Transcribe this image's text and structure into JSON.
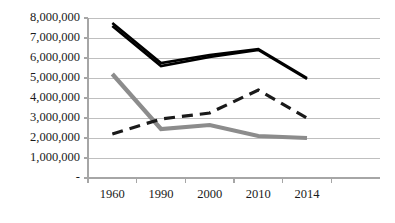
{
  "chart_data": {
    "type": "line",
    "title": "",
    "subtitle": "",
    "xlabel": "",
    "ylabel": "",
    "categories": [
      "1960",
      "1990",
      "2000",
      "2010",
      "2014"
    ],
    "ylim": [
      0,
      8000000
    ],
    "ytick_values": [
      0,
      1000000,
      2000000,
      3000000,
      4000000,
      5000000,
      6000000,
      7000000,
      8000000
    ],
    "ytick_labels": [
      "-",
      "1,000,000",
      "2,000,000",
      "3,000,000",
      "4,000,000",
      "5,000,000",
      "6,000,000",
      "7,000,000",
      "8,000,000"
    ],
    "grid": true,
    "grid_axis": "y",
    "legend": "none",
    "legend_position": "none",
    "series": [
      {
        "name": "series-black-upper",
        "style": "solid",
        "color": "#000000",
        "width": 2.6,
        "values": [
          7750000,
          5750000,
          6150000,
          6450000,
          5000000
        ]
      },
      {
        "name": "series-black-lower",
        "style": "solid",
        "color": "#000000",
        "width": 2.6,
        "values": [
          7600000,
          5600000,
          6050000,
          6400000,
          4950000
        ]
      },
      {
        "name": "series-dashed",
        "style": "dashed",
        "color": "#1a1a1a",
        "width": 3.2,
        "values": [
          2200000,
          2950000,
          3250000,
          4400000,
          3000000
        ]
      },
      {
        "name": "series-gray",
        "style": "solid",
        "color": "#8c8c8c",
        "width": 4.2,
        "values": [
          5200000,
          2450000,
          2650000,
          2100000,
          2000000
        ]
      }
    ]
  },
  "axes": {
    "axis_line_color": "#a6a6a6",
    "grid_color": "#bfbfbf",
    "plot_left": 88,
    "plot_right": 380,
    "plot_top": 18,
    "plot_bottom": 178
  }
}
